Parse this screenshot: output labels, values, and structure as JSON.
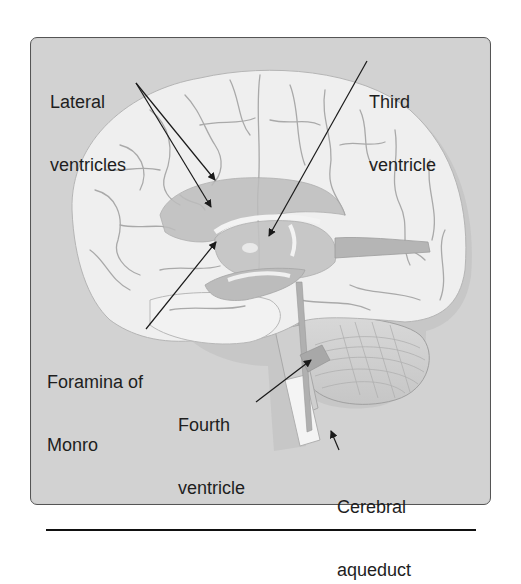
{
  "figure": {
    "colors": {
      "panel_background": "#d2d2d2",
      "panel_border": "#555555",
      "brain_surface": "#efefef",
      "sulci": "#a9a9a9",
      "ventricles": "#bdbdbd",
      "text": "#1e1e1e",
      "arrows": "#1a1a1a"
    },
    "labels": [
      {
        "id": "lateral-ventricles",
        "line1": "Lateral",
        "line2": "ventricles"
      },
      {
        "id": "third-ventricle",
        "line1": "Third",
        "line2": "ventricle"
      },
      {
        "id": "foramina-of-monro",
        "line1": "Foramina of",
        "line2": "Monro"
      },
      {
        "id": "fourth-ventricle",
        "line1": "Fourth",
        "line2": "ventricle"
      },
      {
        "id": "cerebral-aqueduct",
        "line1": "Cerebral",
        "line2": "aqueduct"
      }
    ]
  }
}
